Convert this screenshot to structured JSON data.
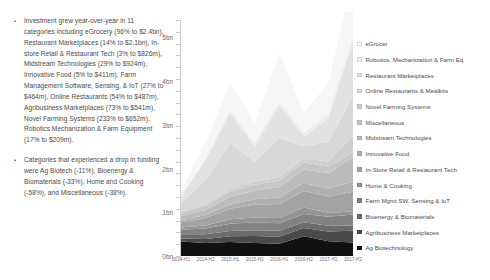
{
  "bullets": [
    {
      "marker": "•",
      "text": "Investment grew year-over-year in 11 categories including eGrocery (96% to $2.4bn), Restaurant Marketplaces (14% to $2.1bn), In-store Retail & Restaurant Tech (3% to $826m), Midstream Technologies (29% to $924m), Innovative Food (5% to $411m), Farm Management Software, Sensing, & IoT (27% to $464m), Online Restaurants (54% to $487m), Agribusiness Marketplaces (73% to $541m), Novel Farming Systems (233% to $652m), Robotics Mechanization & Farm Equipment (17% to $209m)."
    },
    {
      "marker": "•",
      "text": "Categories that experienced a drop in funding were Ag Biotech (-11%), Bioenergy & Biomaterials (-33%), Home and Cooking (-58%), and Miscellaneous (-38%)."
    }
  ],
  "chart_data": {
    "type": "area",
    "title": "",
    "xlabel": "",
    "ylabel": "",
    "stacked": true,
    "grid": false,
    "legend_position": "right",
    "ylim": [
      0,
      5.4
    ],
    "ytick_labels": [
      "0bn",
      "1bn",
      "2bn",
      "3bn",
      "4bn",
      "5bn"
    ],
    "ytick_values": [
      0,
      1,
      2,
      3,
      4,
      5
    ],
    "categories": [
      "2014-H1",
      "2014-H2",
      "2015-H1",
      "2015-H2",
      "2016-H1",
      "2016-H2",
      "2017-H1",
      "2017-H2"
    ],
    "series": [
      {
        "name": "Ag Biotechnology",
        "color": "#111111",
        "values": [
          0.33,
          0.3,
          0.32,
          0.3,
          0.28,
          0.45,
          0.34,
          0.31
        ]
      },
      {
        "name": "Agribusiness Marketplaces",
        "color": "#4a4a4a",
        "values": [
          0.07,
          0.09,
          0.13,
          0.16,
          0.16,
          0.19,
          0.22,
          0.27
        ]
      },
      {
        "name": "Bioenergy & Biomaterials",
        "color": "#6b6b6b",
        "values": [
          0.1,
          0.11,
          0.12,
          0.13,
          0.14,
          0.13,
          0.13,
          0.12
        ]
      },
      {
        "name": "Farm Mgmt SW, Sensing & IoT",
        "color": "#828282",
        "values": [
          0.1,
          0.13,
          0.17,
          0.18,
          0.17,
          0.19,
          0.21,
          0.25
        ]
      },
      {
        "name": "Home & Cooking",
        "color": "#949494",
        "values": [
          0.05,
          0.07,
          0.1,
          0.11,
          0.12,
          0.15,
          0.09,
          0.07
        ]
      },
      {
        "name": "In-Store Retail & Restaurant Tech",
        "color": "#a3a3a3",
        "values": [
          0.12,
          0.17,
          0.24,
          0.29,
          0.32,
          0.38,
          0.37,
          0.45
        ]
      },
      {
        "name": "Innovative Food",
        "color": "#b0b0b0",
        "values": [
          0.05,
          0.07,
          0.1,
          0.13,
          0.15,
          0.18,
          0.18,
          0.23
        ]
      },
      {
        "name": "Midstream Technologies",
        "color": "#bcbcbc",
        "values": [
          0.09,
          0.12,
          0.17,
          0.2,
          0.24,
          0.31,
          0.36,
          0.56
        ]
      },
      {
        "name": "Miscellaneous",
        "color": "#c6c6c6",
        "values": [
          0.06,
          0.09,
          0.12,
          0.13,
          0.14,
          0.16,
          0.14,
          0.1
        ]
      },
      {
        "name": "Novel Farming Systems",
        "color": "#cfcfcf",
        "values": [
          0.03,
          0.04,
          0.06,
          0.07,
          0.08,
          0.09,
          0.12,
          0.4
        ]
      },
      {
        "name": "Online Restaurants & Mealkits",
        "color": "#d8d8d8",
        "values": [
          0.2,
          0.55,
          1.05,
          0.45,
          0.9,
          0.28,
          0.45,
          0.9
        ]
      },
      {
        "name": "Restaurant Marketplaces",
        "color": "#e2e2e2",
        "values": [
          0.15,
          0.45,
          0.7,
          0.35,
          0.75,
          0.22,
          0.55,
          1.25
        ]
      },
      {
        "name": "Robotics, Mechanization & Farm Eq",
        "color": "#ededed",
        "values": [
          0.03,
          0.05,
          0.07,
          0.08,
          0.09,
          0.09,
          0.1,
          0.12
        ]
      },
      {
        "name": "eGrocer",
        "color": "#f6f6f6",
        "values": [
          0.1,
          0.35,
          0.6,
          0.45,
          1.1,
          0.45,
          0.7,
          1.35
        ]
      }
    ]
  },
  "legend": {
    "items": [
      {
        "label": "eGrocer",
        "color": "#f6f6f6"
      },
      {
        "label": "Robotics, Mechanization & Farm Eq",
        "color": "#ededed"
      },
      {
        "label": "Restaurant Marketplaces",
        "color": "#e2e2e2"
      },
      {
        "label": "Online Restaurants & Mealkits",
        "color": "#d8d8d8"
      },
      {
        "label": "Novel Farming Systems",
        "color": "#cfcfcf"
      },
      {
        "label": "Miscellaneous",
        "color": "#c6c6c6"
      },
      {
        "label": "Midstream Technologies",
        "color": "#bcbcbc"
      },
      {
        "label": "Innovative Food",
        "color": "#b0b0b0"
      },
      {
        "label": "In-Store Retail & Restaurant Tech",
        "color": "#a3a3a3"
      },
      {
        "label": "Home & Cooking",
        "color": "#949494"
      },
      {
        "label": "Farm Mgmt SW, Sensing & IoT",
        "color": "#828282"
      },
      {
        "label": "Bioenergy & Biomaterials",
        "color": "#6b6b6b"
      },
      {
        "label": "Agribusiness Marketplaces",
        "color": "#4a4a4a"
      },
      {
        "label": "Ag Biotechnology",
        "color": "#111111"
      }
    ]
  }
}
